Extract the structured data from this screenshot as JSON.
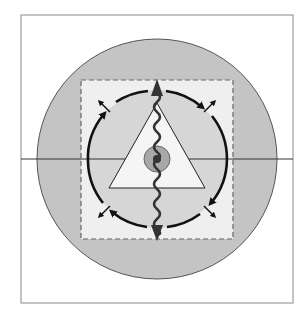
{
  "figure": {
    "width": 308,
    "height": 315,
    "background": "#ffffff",
    "frame": {
      "x": 21,
      "y": 15,
      "w": 272,
      "h": 288,
      "stroke": "#8a8a8a"
    },
    "horizontal_line": {
      "y": 159,
      "x1": 21,
      "x2": 293,
      "stroke": "#333333"
    },
    "outer_circle": {
      "cx": 157,
      "cy": 159,
      "r": 120,
      "fill": "#c4c4c4",
      "stroke": "#555555"
    },
    "dashed_square": {
      "x": 81,
      "y": 80,
      "w": 152,
      "h": 159,
      "fill": "#efefef",
      "stroke": "#666666",
      "dash": "5,3"
    },
    "arc_circle": {
      "cx": 157,
      "cy": 159,
      "r": 69,
      "fill": "#d6d6d6",
      "stroke": "#111111"
    },
    "triangle": {
      "points": "157,103 109,188 205,188",
      "fill": "#f5f5f5",
      "stroke": "#222222"
    },
    "center_circle": {
      "cx": 157,
      "cy": 159,
      "r": 13,
      "fill": "#a8a8a8",
      "stroke": "#666666"
    },
    "center_dot": {
      "cx": 157,
      "cy": 159,
      "r": 4,
      "fill": "#333333"
    },
    "wavy_axis": {
      "x": 157,
      "y1": 84,
      "y2": 236,
      "stroke": "#333333",
      "head_fill": "#333333"
    },
    "accent_colors": {
      "dark": "#111111",
      "mid": "#555555",
      "light": "#efefef"
    }
  }
}
